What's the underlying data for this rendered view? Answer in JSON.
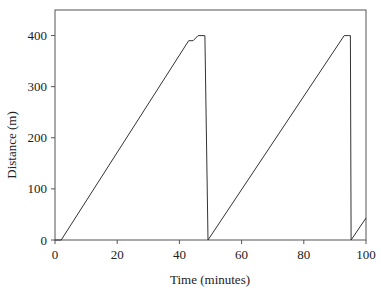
{
  "chart_data": {
    "type": "line",
    "title": "",
    "xlabel": "Time (minutes)",
    "ylabel": "Distance (m)",
    "xlim": [
      0,
      100
    ],
    "ylim": [
      0,
      450
    ],
    "xticks": [
      0,
      20,
      40,
      60,
      80,
      100
    ],
    "yticks": [
      0,
      100,
      200,
      300,
      400
    ],
    "grid": false,
    "legend": null,
    "series": [
      {
        "name": "Distance",
        "color": "#333333",
        "x": [
          0,
          2,
          43,
          44.4,
          46,
          48,
          48.2,
          49.2,
          93,
          94.5,
          95,
          95.2,
          100
        ],
        "y": [
          0,
          0,
          390,
          390,
          400,
          400,
          400,
          0,
          400,
          400,
          400,
          0,
          43
        ]
      }
    ]
  },
  "axes": {
    "x_label": "Time (minutes)",
    "y_label": "Distance (m)",
    "x_tick_labels": [
      "0",
      "20",
      "40",
      "60",
      "80",
      "100"
    ],
    "y_tick_labels": [
      "0",
      "100",
      "200",
      "300",
      "400"
    ]
  }
}
